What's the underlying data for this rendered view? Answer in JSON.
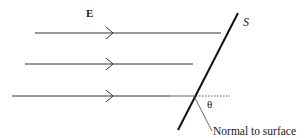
{
  "diagram": {
    "labels": {
      "field": "E",
      "surface": "S",
      "angle": "θ",
      "normal": "Normal to surface"
    },
    "colors": {
      "line": "#333333",
      "surface": "#111111",
      "dotted": "#555555",
      "normal": "#444444",
      "background": "#ffffff"
    },
    "field_lines": [
      {
        "y": 33,
        "x_start": 35,
        "arrow_x": 113
      },
      {
        "y": 64,
        "x_start": 25,
        "arrow_x": 113
      },
      {
        "y": 96,
        "x_start": 12,
        "arrow_x": 113
      }
    ]
  }
}
